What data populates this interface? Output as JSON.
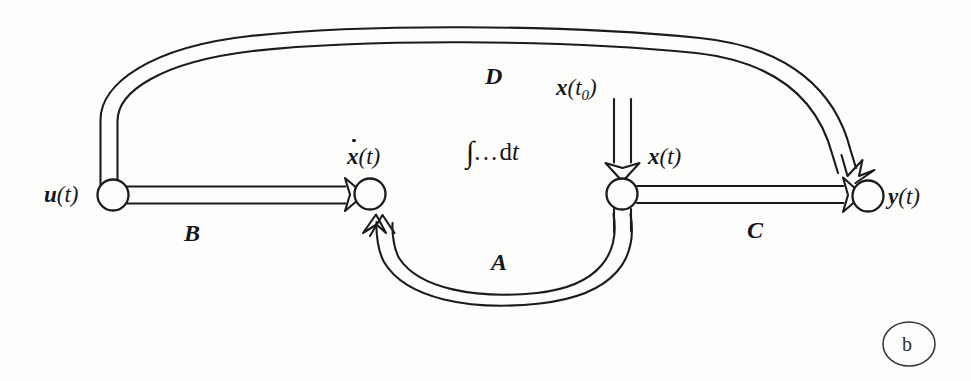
{
  "figure": {
    "caption": "(b)",
    "caption_letter": "b",
    "type": "state-space signal flow diagram"
  },
  "nodes": [
    {
      "id": "u",
      "name": "input-node",
      "label": "u(t)",
      "label_var": "u",
      "label_arg": "(t)",
      "cx": 113,
      "cy": 195,
      "r": 15
    },
    {
      "id": "xdot",
      "name": "summing-node",
      "label": "ẋ(t)",
      "label_var": "x",
      "label_arg": "(t)",
      "cx": 370,
      "cy": 194,
      "r": 15
    },
    {
      "id": "x",
      "name": "state-node",
      "label": "x(t)",
      "label_var": "x",
      "label_arg": "(t)",
      "cx": 622,
      "cy": 194,
      "r": 15
    },
    {
      "id": "y",
      "name": "output-node",
      "label": "y(t)",
      "label_var": "y",
      "label_arg": "(t)",
      "cx": 868,
      "cy": 196,
      "r": 15
    }
  ],
  "edges": [
    {
      "id": "B",
      "name": "edge-b",
      "label": "B",
      "from": "u",
      "to": "xdot"
    },
    {
      "id": "C",
      "name": "edge-c",
      "label": "C",
      "from": "x",
      "to": "y"
    },
    {
      "id": "D",
      "name": "edge-d",
      "label": "D",
      "from": "u",
      "to": "y"
    },
    {
      "id": "A",
      "name": "edge-a",
      "label": "A",
      "from": "x",
      "to": "xdot"
    }
  ],
  "labels": {
    "u_of_t": "u(t)",
    "x_dot_of_t": "ẋ(t)",
    "x_of_t": "x(t)",
    "y_of_t": "y(t)",
    "x_t0": "x(t₀)",
    "x_t0_var": "x",
    "x_t0_open": "(t",
    "x_t0_sub": "0",
    "x_t0_close": ")",
    "integral": "∫…dt",
    "integral_sign": "∫",
    "integral_dots": "...",
    "integral_d": "d",
    "integral_t": "t",
    "matrix_a": "A",
    "matrix_b": "B",
    "matrix_c": "C",
    "matrix_d": "D",
    "var_u": "u",
    "var_x": "x",
    "var_y": "y",
    "arg_t": "(t)"
  },
  "colors": {
    "ink": "#15161a",
    "line": "#1a1b1f",
    "background": "#fdfdfc"
  }
}
